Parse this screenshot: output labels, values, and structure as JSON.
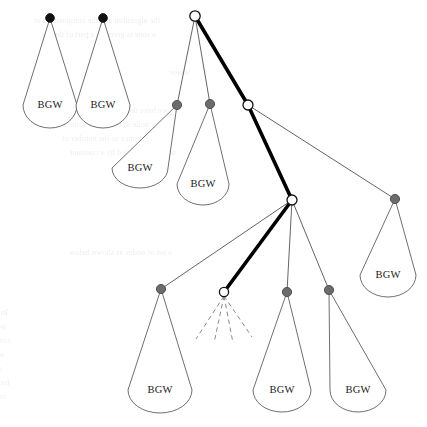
{
  "figure": {
    "width": 427,
    "height": 427,
    "background_color": "#ffffff",
    "leaf_label": "BGW"
  },
  "style": {
    "edge_color": "#3c3c3c",
    "edge_width": 0.8,
    "highlight_edge_color": "#000000",
    "highlight_edge_width": 3.6,
    "black_node_color": "#111111",
    "gray_node_color": "#6b6b6b",
    "hollow_node_fill": "#ffffff",
    "hollow_node_stroke": "#111111",
    "balloon_stroke": "#4a4a4a",
    "balloon_fill": "#ffffff",
    "dashed_edge_color": "#8a8a8a",
    "label_color": "#1a1a1a"
  },
  "nodes": [
    {
      "id": "n-black-1",
      "kind": "black",
      "cx": 50,
      "cy": 18,
      "r": 4.4
    },
    {
      "id": "n-black-2",
      "kind": "black",
      "cx": 103,
      "cy": 18,
      "r": 4.4
    },
    {
      "id": "n-root",
      "kind": "hollow",
      "cx": 195,
      "cy": 16,
      "r": 5.2
    },
    {
      "id": "n-gray-a",
      "kind": "gray",
      "cx": 177,
      "cy": 105,
      "r": 4.6
    },
    {
      "id": "n-gray-b",
      "kind": "gray",
      "cx": 210,
      "cy": 104,
      "r": 4.6
    },
    {
      "id": "n-hollow-2",
      "kind": "hollow",
      "cx": 248,
      "cy": 105,
      "r": 5.0
    },
    {
      "id": "n-hollow-3",
      "kind": "hollow",
      "cx": 292,
      "cy": 200,
      "r": 5.0
    },
    {
      "id": "n-gray-far",
      "kind": "gray",
      "cx": 395,
      "cy": 199,
      "r": 4.6
    },
    {
      "id": "n-gray-c",
      "kind": "gray",
      "cx": 161,
      "cy": 289,
      "r": 4.6
    },
    {
      "id": "n-hollow-4",
      "kind": "hollow",
      "cx": 224,
      "cy": 292,
      "r": 4.6
    },
    {
      "id": "n-gray-d",
      "kind": "gray",
      "cx": 287,
      "cy": 292,
      "r": 4.6
    },
    {
      "id": "n-gray-e",
      "kind": "gray",
      "cx": 329,
      "cy": 290,
      "r": 4.6
    }
  ],
  "edges": [
    {
      "id": "e-root-graya",
      "from": "n-root",
      "to": "n-gray-a",
      "highlight": false
    },
    {
      "id": "e-root-grayb",
      "from": "n-root",
      "to": "n-gray-b",
      "highlight": false
    },
    {
      "id": "e-root-h2",
      "from": "n-root",
      "to": "n-hollow-2",
      "highlight": true
    },
    {
      "id": "e-h2-h3",
      "from": "n-hollow-2",
      "to": "n-hollow-3",
      "highlight": true
    },
    {
      "id": "e-h2-far",
      "from": "n-hollow-2",
      "to": "n-gray-far",
      "highlight": false
    },
    {
      "id": "e-h3-grayc",
      "from": "n-hollow-3",
      "to": "n-gray-c",
      "highlight": false
    },
    {
      "id": "e-h3-h4",
      "from": "n-hollow-3",
      "to": "n-hollow-4",
      "highlight": true
    },
    {
      "id": "e-h3-grayd",
      "from": "n-hollow-3",
      "to": "n-gray-d",
      "highlight": false
    },
    {
      "id": "e-h3-graye",
      "from": "n-hollow-3",
      "to": "n-gray-e",
      "highlight": false
    }
  ],
  "balloons": [
    {
      "id": "bgw-1",
      "anchor": "n-black-1",
      "label": "BGW",
      "cx": 50,
      "cy": 105,
      "rx": 27,
      "ry": 23,
      "label_x": 50,
      "label_y": 108
    },
    {
      "id": "bgw-2",
      "anchor": "n-black-2",
      "label": "BGW",
      "cx": 103,
      "cy": 105,
      "rx": 27,
      "ry": 23,
      "label_x": 103,
      "label_y": 108
    },
    {
      "id": "bgw-3",
      "anchor": "n-gray-a",
      "label": "BGW",
      "cx": 140,
      "cy": 168,
      "rx": 28,
      "ry": 20,
      "label_x": 140,
      "label_y": 171
    },
    {
      "id": "bgw-4",
      "anchor": "n-gray-b",
      "label": "BGW",
      "cx": 203,
      "cy": 184,
      "rx": 26,
      "ry": 21,
      "label_x": 203,
      "label_y": 187
    },
    {
      "id": "bgw-5",
      "anchor": "n-gray-far",
      "label": "BGW",
      "cx": 388,
      "cy": 275,
      "rx": 28,
      "ry": 22,
      "label_x": 388,
      "label_y": 278
    },
    {
      "id": "bgw-6",
      "anchor": "n-gray-c",
      "label": "BGW",
      "cx": 160,
      "cy": 390,
      "rx": 32,
      "ry": 23,
      "label_x": 160,
      "label_y": 393
    },
    {
      "id": "bgw-7",
      "anchor": "n-gray-d",
      "label": "BGW",
      "cx": 282,
      "cy": 390,
      "rx": 29,
      "ry": 22,
      "label_x": 282,
      "label_y": 393
    },
    {
      "id": "bgw-8",
      "anchor": "n-gray-e",
      "label": "BGW",
      "cx": 358,
      "cy": 390,
      "rx": 28,
      "ry": 22,
      "label_x": 358,
      "label_y": 393
    }
  ],
  "dashed_edges": {
    "from": "n-hollow-4",
    "count": 4,
    "ends": [
      {
        "x": 196,
        "y": 339
      },
      {
        "x": 214,
        "y": 343
      },
      {
        "x": 233,
        "y": 343
      },
      {
        "x": 252,
        "y": 337
      }
    ]
  },
  "bleed_through_text": {
    "note": "Faint mirrored show-through text from the reverse of the printed page.",
    "lines": [
      {
        "top": 14,
        "left": 160,
        "text": "the algorithm and the computation of"
      },
      {
        "top": 28,
        "left": 156,
        "text": "a state is given as a part of the set"
      },
      {
        "top": 66,
        "left": 190,
        "text": "where"
      },
      {
        "top": 104,
        "left": 168,
        "text": "we have that the closed set and"
      },
      {
        "top": 118,
        "left": 170,
        "text": "every node in the tree is visited"
      },
      {
        "top": 132,
        "left": 164,
        "text": "at most once so the number of"
      },
      {
        "top": 146,
        "left": 176,
        "text": "nodes is bounded by a constant"
      },
      {
        "top": 246,
        "left": 172,
        "text": "a set of nodes as shown below"
      },
      {
        "top": 306,
        "left": 8,
        "text": "In this case the goal of the search"
      },
      {
        "top": 320,
        "left": 6,
        "text": "is to find the smallest set which"
      },
      {
        "top": 334,
        "left": 10,
        "text": "covers all the states in the graph"
      },
      {
        "top": 348,
        "left": 4,
        "text": "and the resulting algorithm can be"
      },
      {
        "top": 362,
        "left": 2,
        "text": "shown to run in polynomial time"
      },
      {
        "top": 376,
        "left": 10,
        "text": "for the class of instances we have"
      },
      {
        "top": 390,
        "left": 6,
        "text": "considered in the previous section"
      }
    ]
  }
}
